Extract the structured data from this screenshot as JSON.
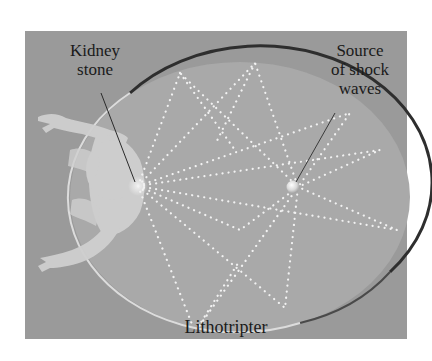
{
  "figure": {
    "labels": {
      "kidney_stone": [
        "Kidney",
        "stone"
      ],
      "source": [
        "Source",
        "of shock",
        "waves"
      ],
      "device": "Lithotripter"
    },
    "elements": {
      "ellipse": "elliptical reflector chamber",
      "kidney_stone_focus": "left focus of ellipse",
      "shock_source_focus": "right focus of ellipse",
      "wave_paths": "dotted shock wave paths reflecting from source to kidney stone",
      "patient": "reclining human figure with arms raised"
    },
    "colors": {
      "background": "#9a9a9a",
      "ellipse_fill": "#a9a9a9",
      "ellipse_rim_dark": "#2e2e2e",
      "ellipse_rim_light": "#d8d8d8",
      "dots": "#f2f2f2",
      "figure": "#cfcfcf",
      "text": "#1a1a1a"
    }
  }
}
